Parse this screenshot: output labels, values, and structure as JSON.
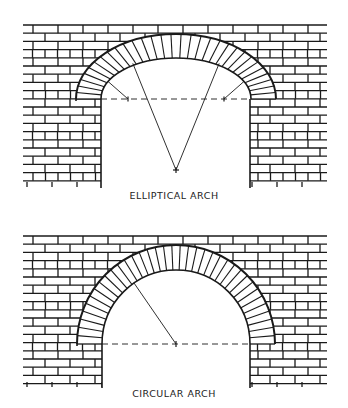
{
  "figures": [
    {
      "id": "elliptical",
      "caption": "ELLIPTICAL ARCH",
      "wall": {
        "x0": 23,
        "x1": 327,
        "y0": 25,
        "y1": 182,
        "row_h": 8.2,
        "brick_w": 25
      },
      "opening": {
        "left": 101,
        "right": 250,
        "springing_y": 99
      },
      "arch": {
        "type": "elliptical",
        "cx": 176,
        "cy": 99,
        "inner_rx": 75,
        "inner_ry": 41,
        "outer_rx": 100,
        "outer_ry": 65,
        "voussoirs": 31
      },
      "construction": {
        "apex": [
          176,
          170
        ],
        "side_centers": [
          [
            128,
            99
          ],
          [
            224,
            99
          ]
        ]
      }
    },
    {
      "id": "circular",
      "caption": "CIRCULAR ARCH",
      "wall": {
        "x0": 23,
        "x1": 327,
        "y0": 236,
        "y1": 382,
        "row_h": 8.2,
        "brick_w": 25
      },
      "opening": {
        "left": 102,
        "right": 250,
        "springing_y": 344
      },
      "arch": {
        "type": "circular",
        "cx": 176,
        "cy": 344,
        "inner_r": 74,
        "outer_r": 99,
        "voussoirs": 37
      },
      "construction": {
        "center": [
          176,
          344
        ],
        "radius_end": [
          134,
          283
        ]
      }
    }
  ],
  "colors": {
    "line": "#1a1a1a",
    "background": "#ffffff"
  }
}
